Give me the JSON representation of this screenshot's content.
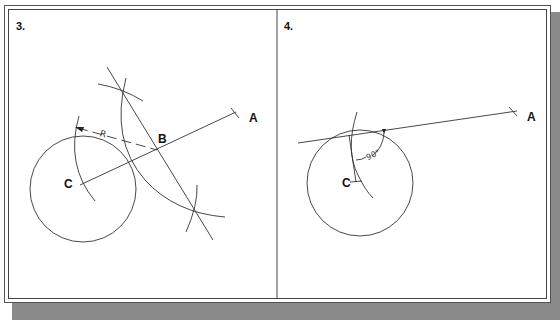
{
  "figure": {
    "panels": [
      {
        "number": "3.",
        "labels": {
          "point_a": "A",
          "point_b": "B",
          "center": "C",
          "radius": "R"
        }
      },
      {
        "number": "4.",
        "labels": {
          "point_a": "A",
          "center": "C",
          "angle": "90°"
        }
      }
    ]
  },
  "colors": {
    "line": "#333333",
    "frame": "#444444",
    "shadow": "#8a8a8a",
    "background": "#ffffff"
  }
}
